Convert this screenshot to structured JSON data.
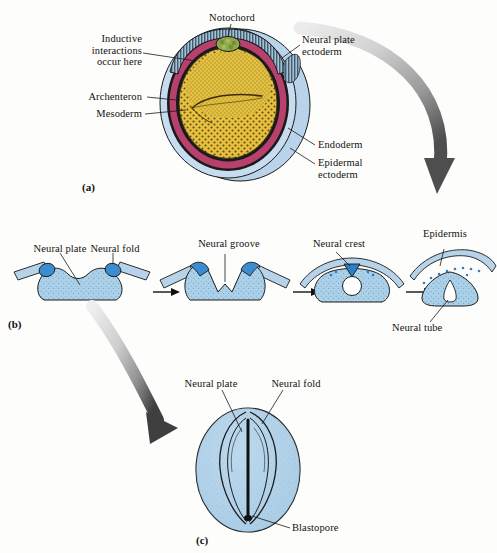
{
  "figure": {
    "background_color": "#fdfdfb",
    "panels": [
      {
        "id": "a",
        "id_label": "(a)",
        "caption": "Cross section of a neurula-stage embryo",
        "labels": [
          {
            "name": "notochord",
            "text": "Notochord"
          },
          {
            "name": "neural-plate-ectoderm",
            "text": "Neural plate\nectoderm"
          },
          {
            "name": "inductive-interactions",
            "text": "Inductive\ninteractions\noccur here"
          },
          {
            "name": "archenteron",
            "text": "Archenteron"
          },
          {
            "name": "mesoderm",
            "text": "Mesoderm"
          },
          {
            "name": "endoderm",
            "text": "Endoderm"
          },
          {
            "name": "epidermal-ectoderm",
            "text": "Epidermal\nectoderm"
          }
        ]
      },
      {
        "id": "b",
        "id_label": "(b)",
        "caption": "Stages of neural tube formation in cross section",
        "labels": [
          {
            "name": "neural-plate",
            "text": "Neural plate"
          },
          {
            "name": "neural-fold",
            "text": "Neural fold"
          },
          {
            "name": "neural-groove",
            "text": "Neural groove"
          },
          {
            "name": "neural-crest",
            "text": "Neural crest"
          },
          {
            "name": "epidermis",
            "text": "Epidermis"
          },
          {
            "name": "neural-tube",
            "text": "Neural tube"
          }
        ],
        "stages": [
          {
            "name": "stage-neural-plate",
            "order": 1
          },
          {
            "name": "stage-neural-groove",
            "order": 2
          },
          {
            "name": "stage-neural-tube-closing",
            "order": 3
          },
          {
            "name": "stage-neural-tube-closed",
            "order": 4
          }
        ],
        "stage_arrows": 3
      },
      {
        "id": "c",
        "id_label": "(c)",
        "caption": "Dorsal view of neurula embryo",
        "labels": [
          {
            "name": "neural-plate",
            "text": "Neural plate"
          },
          {
            "name": "neural-fold",
            "text": "Neural fold"
          },
          {
            "name": "blastopore",
            "text": "Blastopore"
          }
        ]
      }
    ],
    "colors": {
      "epidermal_ectoderm": "#b9d4ea",
      "neural_plate_ectoderm": "#9dc4e0",
      "mesoderm": "#b8406d",
      "endoderm_yolk": "#e8c13f",
      "notochord": "#8fa84a",
      "outline": "#1a1a1a",
      "neural_fold": "#3b8dd0",
      "tissue_blue": "#abd0e8",
      "arrow_gray_light": "#e2e2e2",
      "arrow_gray_dark": "#5b5b5b"
    }
  }
}
